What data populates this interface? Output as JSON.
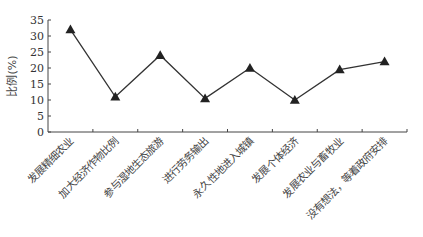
{
  "chart_data": {
    "type": "line",
    "title": "",
    "xlabel": "",
    "ylabel": "比例(%)",
    "ylim": [
      0,
      35
    ],
    "yticks": [
      0,
      5,
      10,
      15,
      20,
      25,
      30,
      35
    ],
    "grid": false,
    "marker": "triangle",
    "categories": [
      "发展精细农业",
      "加大经济作物比例",
      "参与湿地生态旅游",
      "进行劳务输出",
      "永久性地进入城镇",
      "发展个体经济",
      "发展农业与畜牧业",
      "没有想法，等着政府安排"
    ],
    "series": [
      {
        "name": "比例",
        "values": [
          32,
          11,
          24,
          10.5,
          20,
          10,
          19.5,
          22
        ],
        "color": "#333333"
      }
    ]
  }
}
